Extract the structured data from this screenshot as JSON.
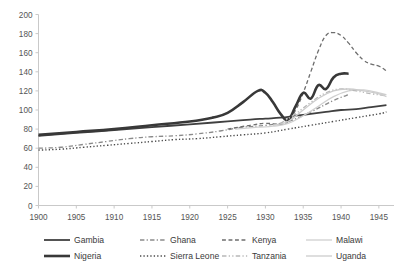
{
  "chart_data": {
    "type": "line",
    "title": "",
    "xlabel": "",
    "ylabel": "",
    "xlim": [
      1900,
      1947
    ],
    "ylim": [
      0,
      200
    ],
    "grid": false,
    "legend_position": "bottom",
    "x_ticks": [
      "1900",
      "1905",
      "1910",
      "1915",
      "1920",
      "1925",
      "1930",
      "1935",
      "1940",
      "1945"
    ],
    "y_ticks": [
      "0",
      "20",
      "40",
      "60",
      "80",
      "100",
      "120",
      "140",
      "160",
      "180",
      "200"
    ],
    "series": [
      {
        "name": "Gambia",
        "color": "#404040",
        "style": "solid",
        "width": 1.8,
        "x": [
          1900,
          1905,
          1910,
          1915,
          1920,
          1925,
          1928,
          1930,
          1932,
          1934,
          1936,
          1938,
          1940,
          1942,
          1944,
          1946
        ],
        "values": [
          73,
          76,
          79,
          82,
          85,
          88,
          90,
          91,
          92,
          94,
          96,
          98,
          100,
          101,
          103,
          105
        ]
      },
      {
        "name": "Ghana",
        "color": "#8a8a8a",
        "style": "dashdot",
        "width": 1.3,
        "x": [
          1900,
          1903,
          1906,
          1909,
          1912,
          1915,
          1918,
          1921,
          1924,
          1927,
          1930,
          1933,
          1936,
          1939,
          1941
        ],
        "values": [
          60,
          61,
          64,
          67,
          70,
          72,
          73,
          75,
          78,
          82,
          84,
          88,
          98,
          110,
          116
        ]
      },
      {
        "name": "Kenya",
        "color": "#6e6e6e",
        "style": "dashed",
        "width": 1.3,
        "x": [
          1925,
          1928,
          1930,
          1932,
          1933,
          1934,
          1935,
          1936,
          1937,
          1938,
          1939,
          1940,
          1941,
          1942,
          1943,
          1944,
          1945,
          1946
        ],
        "values": [
          80,
          84,
          86,
          85,
          88,
          100,
          118,
          140,
          162,
          178,
          181,
          178,
          170,
          160,
          152,
          148,
          146,
          141
        ]
      },
      {
        "name": "Malawi",
        "color": "#d0d0d0",
        "style": "solid",
        "width": 1.3,
        "x": [
          1926,
          1929,
          1931,
          1933,
          1935,
          1937,
          1939,
          1941,
          1943,
          1945,
          1946
        ],
        "values": [
          80,
          82,
          83,
          86,
          94,
          104,
          114,
          120,
          121,
          118,
          116
        ]
      },
      {
        "name": "Nigeria",
        "color": "#383838",
        "style": "solid",
        "width": 2.6,
        "x": [
          1900,
          1905,
          1910,
          1915,
          1920,
          1923,
          1925,
          1927,
          1929,
          1930,
          1931,
          1932,
          1933,
          1934,
          1935,
          1936,
          1937,
          1938,
          1939,
          1940,
          1941
        ],
        "values": [
          74,
          77,
          80,
          84,
          88,
          92,
          97,
          108,
          120,
          118,
          108,
          96,
          90,
          104,
          118,
          112,
          126,
          122,
          134,
          138,
          138
        ]
      },
      {
        "name": "Sierra Leone",
        "color": "#4a4a4a",
        "style": "dotted",
        "width": 1.4,
        "x": [
          1900,
          1903,
          1906,
          1909,
          1912,
          1915,
          1918,
          1921,
          1924,
          1927,
          1930,
          1933,
          1936,
          1939,
          1942,
          1945,
          1946
        ],
        "values": [
          58,
          59,
          61,
          63,
          65,
          67,
          69,
          70,
          72,
          74,
          76,
          80,
          84,
          88,
          92,
          96,
          98
        ]
      },
      {
        "name": "Tanzania",
        "color": "#b8b8b8",
        "style": "dashdotdot",
        "width": 1.4,
        "x": [
          1932,
          1934,
          1936,
          1938,
          1940,
          1942,
          1944,
          1946
        ],
        "values": [
          86,
          96,
          108,
          118,
          122,
          120,
          117,
          115
        ]
      },
      {
        "name": "Uganda",
        "color": "#cccccc",
        "style": "solid",
        "width": 1.3,
        "x": [
          1931,
          1933,
          1935,
          1937,
          1939,
          1941,
          1943,
          1945,
          1946
        ],
        "values": [
          84,
          88,
          100,
          112,
          120,
          122,
          120,
          117,
          114
        ]
      }
    ]
  },
  "legend": {
    "entries": [
      {
        "label": "Gambia"
      },
      {
        "label": "Ghana"
      },
      {
        "label": "Kenya"
      },
      {
        "label": "Malawi"
      },
      {
        "label": "Nigeria"
      },
      {
        "label": "Sierra Leone"
      },
      {
        "label": "Tanzania"
      },
      {
        "label": "Uganda"
      }
    ]
  }
}
